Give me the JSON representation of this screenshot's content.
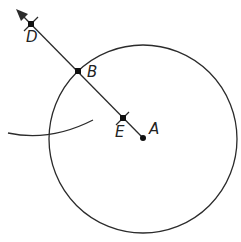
{
  "diagram": {
    "type": "geometric-construction",
    "colors": {
      "background": "#ffffff",
      "stroke": "#2b2b2b",
      "text": "#222222"
    },
    "circle": {
      "center": "A",
      "cx": 143,
      "cy": 139,
      "r": 94
    },
    "points": [
      {
        "id": "A",
        "label": "A",
        "x": 143,
        "y": 138,
        "marker": "dot",
        "label_x": 149,
        "label_y": 134
      },
      {
        "id": "E",
        "label": "E",
        "x": 123,
        "y": 118,
        "marker": "square-with-tick",
        "label_x": 115,
        "label_y": 136
      },
      {
        "id": "B",
        "label": "B",
        "x": 78,
        "y": 71,
        "marker": "square",
        "label_x": 87,
        "label_y": 77
      },
      {
        "id": "D",
        "label": "D",
        "x": 31,
        "y": 24,
        "marker": "square-with-tick",
        "label_x": 26,
        "label_y": 42
      }
    ],
    "ray": {
      "from": "A",
      "through": "B",
      "to": "D",
      "arrow_tip": {
        "x": 17,
        "y": 10
      }
    },
    "arc": {
      "start": {
        "x": 8,
        "y": 133
      },
      "mid": {
        "x": 48,
        "y": 136
      },
      "end": {
        "x": 93,
        "y": 120
      }
    }
  }
}
